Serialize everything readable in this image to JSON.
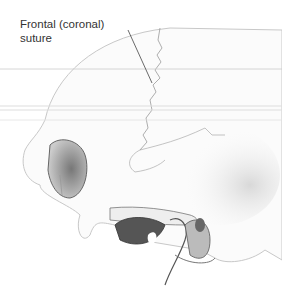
{
  "figure": {
    "label": {
      "line1": "Frontal (coronal)",
      "line2": "suture"
    }
  }
}
